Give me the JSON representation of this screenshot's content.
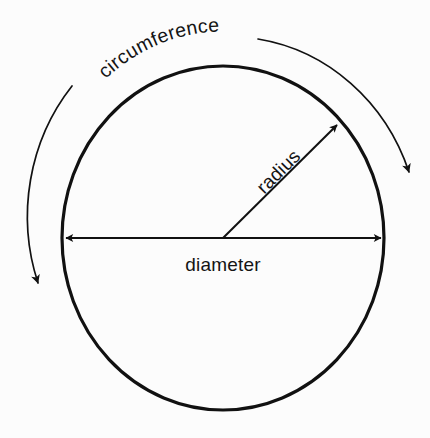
{
  "figure": {
    "background_color": "#fcfcfc",
    "stroke_color": "#111111",
    "text_color": "#141414"
  },
  "labels": {
    "circumference": "circumference",
    "radius": "radius",
    "diameter": "diameter"
  },
  "icons": {
    "circle_outline": "circle-outline-icon",
    "arrow_left": "arrow-left-icon",
    "arrow_right": "arrow-right-icon",
    "arrow_up_right": "arrow-up-right-icon",
    "arc_arrow_down": "arc-arrow-down-icon",
    "leader_line": "leader-line-icon"
  },
  "geometry": {
    "circle": {
      "center_x": 223,
      "center_y": 238,
      "radius_x": 161,
      "radius_y": 172,
      "stroke_width": 3.2
    },
    "diameter_line": {
      "x1": 62,
      "y1": 238,
      "x2": 384,
      "y2": 238,
      "arrowheads": "both",
      "stroke_width": 2
    },
    "radius_line": {
      "x1": 223,
      "y1": 238,
      "x2": 340,
      "y2": 122,
      "arrowheads": "end",
      "stroke_width": 2,
      "angle_deg": -45
    },
    "circumference_arc": {
      "outer_radius_x": 190,
      "outer_radius_y": 202,
      "left_arrow_tip_x": 36,
      "left_arrow_tip_y": 291,
      "right_arrow_tip_x": 412,
      "right_arrow_tip_y": 179,
      "stroke_width": 1.6
    },
    "label_positions": {
      "diameter_x": 223,
      "diameter_y": 268,
      "radius_rotation_deg": -45,
      "circumference_path_radius": 176
    }
  }
}
